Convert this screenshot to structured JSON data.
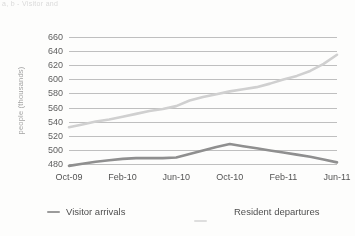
{
  "top_text": "a, b - Visitor and",
  "chart_data": {
    "type": "line",
    "title": "",
    "xlabel": "",
    "ylabel": "people (thousands)",
    "x": [
      "Oct-09",
      "Nov-09",
      "Dec-09",
      "Jan-10",
      "Feb-10",
      "Mar-10",
      "Apr-10",
      "May-10",
      "Jun-10",
      "Jul-10",
      "Aug-10",
      "Sep-10",
      "Oct-10",
      "Nov-10",
      "Dec-10",
      "Jan-11",
      "Feb-11",
      "Mar-11",
      "Apr-11",
      "May-11",
      "Jun-11"
    ],
    "xtick_labels": [
      "Oct-09",
      "Feb-10",
      "Jun-10",
      "Oct-10",
      "Feb-11",
      "Jun-11"
    ],
    "ytick_labels": [
      "660",
      "640",
      "620",
      "600",
      "580",
      "560",
      "540",
      "520",
      "500",
      "480"
    ],
    "ylim": [
      474,
      666
    ],
    "ytick_values": [
      660,
      640,
      620,
      600,
      580,
      560,
      540,
      520,
      500,
      480
    ],
    "grid": true,
    "grid_color": "#a9a9a9",
    "legend_position": "bottom",
    "series": [
      {
        "name": "Visitor arrivals",
        "color": "#d2d2d2",
        "values": [
          532,
          536,
          540,
          543,
          547,
          551,
          555,
          558,
          562,
          570,
          575,
          579,
          583,
          586,
          589,
          594,
          600,
          605,
          612,
          622,
          635
        ]
      },
      {
        "name": "Resident departures",
        "color": "#8d8d8d",
        "values": [
          477,
          480,
          483,
          485,
          487,
          488,
          488,
          488,
          489,
          494,
          499,
          504,
          508,
          505,
          502,
          499,
          496,
          493,
          490,
          486,
          482
        ]
      }
    ]
  },
  "legend": {
    "items": [
      {
        "label": "Visitor arrivals",
        "color": "#9a9a9a"
      },
      {
        "label": "Resident departures",
        "color": "#e0e0e0"
      }
    ]
  }
}
